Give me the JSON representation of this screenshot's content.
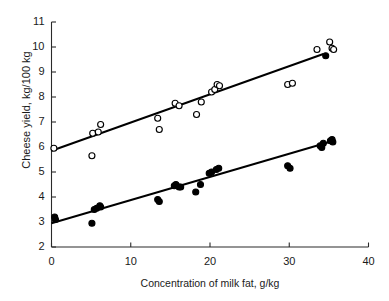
{
  "chart_data": {
    "type": "scatter",
    "title": "",
    "xlabel": "Concentration of milk fat, g/kg",
    "ylabel": "Cheese yield, kg/100 kg",
    "xlim": [
      0,
      40
    ],
    "ylim": [
      2,
      11
    ],
    "xticks": [
      0,
      10,
      20,
      30,
      40
    ],
    "yticks": [
      2,
      3,
      4,
      5,
      6,
      7,
      8,
      9,
      10,
      11
    ],
    "grid": false,
    "legend": "none",
    "series": [
      {
        "name": "open-circles",
        "marker": "open circle",
        "color": "#000000",
        "points": [
          [
            0.3,
            5.95
          ],
          [
            5.1,
            5.65
          ],
          [
            5.2,
            6.55
          ],
          [
            5.9,
            6.6
          ],
          [
            6.2,
            6.9
          ],
          [
            13.4,
            7.15
          ],
          [
            13.6,
            6.7
          ],
          [
            15.6,
            7.75
          ],
          [
            16.1,
            7.65
          ],
          [
            18.3,
            7.3
          ],
          [
            18.9,
            7.8
          ],
          [
            20.2,
            8.2
          ],
          [
            20.6,
            8.3
          ],
          [
            20.9,
            8.5
          ],
          [
            21.2,
            8.45
          ],
          [
            29.8,
            8.5
          ],
          [
            30.4,
            8.55
          ],
          [
            33.5,
            9.9
          ],
          [
            35.1,
            10.2
          ],
          [
            35.4,
            9.95
          ],
          [
            35.6,
            9.9
          ]
        ],
        "fit_line": {
          "x0": 0,
          "y0": 5.85,
          "x1": 34.3,
          "y1": 9.72
        }
      },
      {
        "name": "filled-circles",
        "marker": "filled circle",
        "color": "#000000",
        "points": [
          [
            0.4,
            3.2
          ],
          [
            0.5,
            3.1
          ],
          [
            5.1,
            2.95
          ],
          [
            5.4,
            3.5
          ],
          [
            5.7,
            3.55
          ],
          [
            6.1,
            3.65
          ],
          [
            6.2,
            3.6
          ],
          [
            13.4,
            3.9
          ],
          [
            13.6,
            3.82
          ],
          [
            15.5,
            4.45
          ],
          [
            15.7,
            4.5
          ],
          [
            16.1,
            4.4
          ],
          [
            16.3,
            4.4
          ],
          [
            18.2,
            4.2
          ],
          [
            18.8,
            4.5
          ],
          [
            19.9,
            4.95
          ],
          [
            20.2,
            5.0
          ],
          [
            20.8,
            5.1
          ],
          [
            21.1,
            5.15
          ],
          [
            29.8,
            5.25
          ],
          [
            30.1,
            5.15
          ],
          [
            33.9,
            6.05
          ],
          [
            34.1,
            5.98
          ],
          [
            34.3,
            6.15
          ],
          [
            35.2,
            6.25
          ],
          [
            35.4,
            6.3
          ],
          [
            35.5,
            6.2
          ],
          [
            34.6,
            9.65
          ]
        ],
        "fit_line": {
          "x0": 0,
          "y0": 2.95,
          "x1": 35.6,
          "y1": 6.25
        }
      }
    ]
  },
  "axes": {
    "x_label": "Concentration of milk fat, g/kg",
    "y_label": "Cheese yield, kg/100 kg",
    "x_tick_labels": [
      "0",
      "10",
      "20",
      "30",
      "40"
    ],
    "y_tick_labels": [
      "2",
      "3",
      "4",
      "5",
      "6",
      "7",
      "8",
      "9",
      "10",
      "11"
    ]
  },
  "style": {
    "axis_color": "#2a2a2a",
    "marker_color": "#000000",
    "line_color": "#000000",
    "background": "#ffffff"
  }
}
